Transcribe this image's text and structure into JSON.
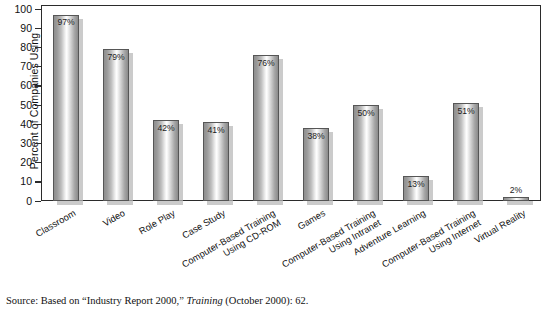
{
  "chart_data": {
    "type": "bar",
    "title": "",
    "xlabel": "",
    "ylabel": "Percent of Companies Using",
    "ylim": [
      0,
      100
    ],
    "ytick_step": 10,
    "yticks": [
      100,
      90,
      80,
      70,
      60,
      50,
      40,
      30,
      20,
      10,
      0
    ],
    "grid": false,
    "legend": "none",
    "categories": [
      "Classroom",
      "Video",
      "Role Play",
      "Case Study",
      "Computer-Based Training Using CD-ROM",
      "Games",
      "Computer-Based Training Using Intranet",
      "Adventure Learning",
      "Computer-Based Training Using Internet",
      "Virtual Reality"
    ],
    "values": [
      97,
      79,
      42,
      41,
      76,
      38,
      50,
      13,
      51,
      2
    ],
    "value_labels": [
      "97%",
      "79%",
      "42%",
      "41%",
      "76%",
      "38%",
      "50%",
      "13%",
      "51%",
      "2%"
    ],
    "label_position": [
      "inside",
      "inside",
      "inside",
      "inside",
      "inside",
      "inside",
      "inside",
      "inside",
      "inside",
      "outside"
    ]
  },
  "axis": {
    "y_title": "Percent of Companies Using"
  },
  "categories_wrapped": [
    {
      "line1": "Classroom",
      "line2": ""
    },
    {
      "line1": "Video",
      "line2": ""
    },
    {
      "line1": "Role Play",
      "line2": ""
    },
    {
      "line1": "Case Study",
      "line2": ""
    },
    {
      "line1": "Computer-Based Training",
      "line2": "Using CD-ROM"
    },
    {
      "line1": "Games",
      "line2": ""
    },
    {
      "line1": "Computer-Based Training",
      "line2": "Using Intranet"
    },
    {
      "line1": "Adventure Learning",
      "line2": ""
    },
    {
      "line1": "Computer-Based Training",
      "line2": "Using Internet"
    },
    {
      "line1": "Virtual Reality",
      "line2": ""
    }
  ],
  "source": {
    "prefix": "Source: Based on “Industry Report 2000,” ",
    "italic": "Training",
    "suffix": " (October 2000): 62."
  },
  "colors": {
    "frame": "#2b2b2b",
    "bar_edge": "#565656",
    "bar_light": "#ffffff",
    "bar_dark": "#8a8a8a",
    "shadow": "#b9b9b9",
    "text": "#111111",
    "background": "#ffffff"
  }
}
